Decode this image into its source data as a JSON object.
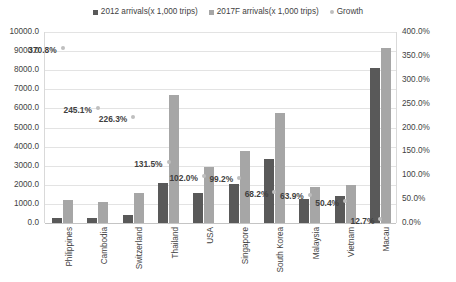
{
  "chart_data": {
    "type": "bar",
    "title": "",
    "subtitle": "",
    "xlabel": "",
    "ylabel": "",
    "ylim": [
      0,
      10000
    ],
    "y2lim": [
      0,
      400
    ],
    "grid": true,
    "legend_position": "top-center",
    "categories": [
      "Philippines",
      "Cambodia",
      "Switzerland",
      "Thailand",
      "USA",
      "Singapore",
      "South Korea",
      "Malaysia",
      "Vietnam",
      "Macau"
    ],
    "series": [
      {
        "name": "2012 arrivals(x 1,000 trips)",
        "type": "bar",
        "axis": "left",
        "color": "#595959",
        "values": [
          250,
          270,
          440,
          2100,
          1560,
          2040,
          3350,
          1250,
          1410,
          8100
        ]
      },
      {
        "name": "2017F arrivals(x 1,000 trips)",
        "type": "bar",
        "axis": "left",
        "color": "#a6a6a6",
        "values": [
          1180,
          1090,
          1550,
          6700,
          2940,
          3750,
          5750,
          1880,
          2000,
          9150
        ]
      },
      {
        "name": "Growth",
        "type": "scatter",
        "axis": "right",
        "color": "#bfbfbf",
        "values": [
          370.8,
          245.1,
          226.3,
          131.5,
          102.0,
          99.2,
          68.2,
          63.9,
          50.4,
          12.7
        ],
        "labels": [
          "370.8%",
          "245.1%",
          "226.3%",
          "131.5%",
          "102.0%",
          "99.2%",
          "68.2%",
          "63.9%",
          "50.4%",
          "12.7%"
        ]
      }
    ],
    "yticks_left": [
      "0.0",
      "1000.0",
      "2000.0",
      "3000.0",
      "4000.0",
      "5000.0",
      "6000.0",
      "7000.0",
      "8000.0",
      "9000.0",
      "10000.0"
    ],
    "yticks_right": [
      "0.0%",
      "50.0%",
      "100.0%",
      "150.0%",
      "200.0%",
      "250.0%",
      "300.0%",
      "350.0%",
      "400.0%"
    ]
  },
  "legend": {
    "items": [
      {
        "label": "2012 arrivals(x 1,000 trips)",
        "marker": "square",
        "color": "#595959"
      },
      {
        "label": "2017F arrivals(x 1,000 trips)",
        "marker": "square",
        "color": "#a6a6a6"
      },
      {
        "label": "Growth",
        "marker": "dot",
        "color": "#bfbfbf"
      }
    ]
  }
}
